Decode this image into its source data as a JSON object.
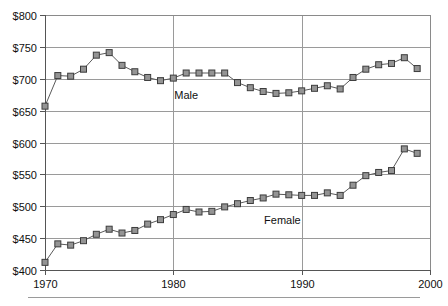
{
  "chart_data": {
    "type": "line",
    "title": "",
    "subtitle": "",
    "xlabel": "",
    "ylabel": "",
    "xlim": [
      1970,
      2000
    ],
    "ylim": [
      400,
      800
    ],
    "ytick_labels": [
      "$800",
      "$750",
      "$700",
      "$650",
      "$600",
      "$550",
      "$500",
      "$450",
      "$400"
    ],
    "ytick_values": [
      800,
      750,
      700,
      650,
      600,
      550,
      500,
      450,
      400
    ],
    "xtick_labels": [
      "1970",
      "1980",
      "1990",
      "2000"
    ],
    "xtick_values": [
      1970,
      1980,
      1990,
      2000
    ],
    "grid": "horizontal-and-vertical",
    "legend_position": "inline-annotation",
    "x": [
      1970,
      1971,
      1972,
      1973,
      1974,
      1975,
      1976,
      1977,
      1978,
      1979,
      1980,
      1981,
      1982,
      1983,
      1984,
      1985,
      1986,
      1987,
      1988,
      1989,
      1990,
      1991,
      1992,
      1993,
      1994,
      1995,
      1996,
      1997,
      1998,
      1999
    ],
    "series": [
      {
        "name": "Male",
        "label": "Male",
        "marker": "square",
        "values": [
          657,
          705,
          704,
          715,
          737,
          741,
          721,
          711,
          702,
          697,
          701,
          709,
          709,
          709,
          709,
          694,
          686,
          680,
          677,
          678,
          681,
          685,
          689,
          684,
          702,
          715,
          722,
          724,
          733,
          716
        ]
      },
      {
        "name": "Female",
        "label": "Female",
        "marker": "square",
        "values": [
          412,
          441,
          439,
          446,
          456,
          464,
          458,
          462,
          472,
          479,
          487,
          495,
          491,
          492,
          499,
          504,
          509,
          513,
          519,
          518,
          517,
          517,
          521,
          517,
          533,
          548,
          553,
          556,
          590,
          583
        ]
      }
    ],
    "annotations": [
      {
        "text": "Male",
        "x": 1981,
        "y": 668
      },
      {
        "text": "Female",
        "x": 1988.5,
        "y": 473
      }
    ]
  },
  "colors": {
    "marker_fill": "#949494",
    "marker_stroke": "#3c3c3c",
    "line": "#5a5a5a",
    "gridline": "#9a9a9a",
    "axis": "#555555",
    "text": "#101010",
    "background": "#ffffff"
  }
}
